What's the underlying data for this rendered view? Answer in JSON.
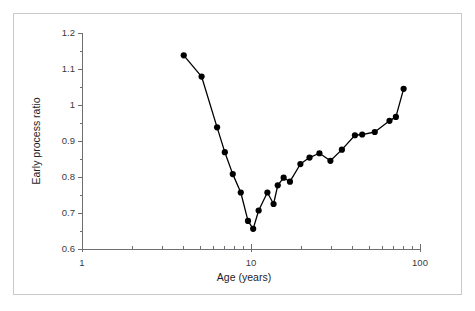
{
  "figure": {
    "background_color": "#ffffff",
    "frame_color": "#c9c9cc",
    "axis_color": "#6f6f73",
    "series_color": "#000000"
  },
  "chart_data": {
    "type": "line",
    "title": "",
    "subtitle": "",
    "xlabel": "Age (years)",
    "ylabel": "Early process ratio",
    "xscale": "log",
    "yscale": "linear",
    "xlim": [
      1,
      100
    ],
    "ylim": [
      0.6,
      1.2
    ],
    "grid": false,
    "legend": null,
    "legend_position": "none",
    "marker": "filled-circle",
    "xticks_major": [
      1,
      10,
      100
    ],
    "xtick_major_labels": [
      "1",
      "10",
      "100"
    ],
    "xticks_minor": [
      2,
      3,
      4,
      5,
      6,
      7,
      8,
      9,
      20,
      30,
      40,
      50,
      60,
      70,
      80,
      90
    ],
    "yticks": [
      0.6,
      0.7,
      0.8,
      0.9,
      1.0,
      1.1,
      1.2
    ],
    "ytick_labels": [
      "0.6",
      "0.7",
      "0.8",
      "0.9",
      "1",
      "1.1",
      "1.2"
    ],
    "series": [
      {
        "name": "Early process ratio",
        "x": [
          4.0,
          5.1,
          6.3,
          7.0,
          7.8,
          8.7,
          9.6,
          10.3,
          11.1,
          12.5,
          13.6,
          14.4,
          15.6,
          17.0,
          19.6,
          22.2,
          25.4,
          29.5,
          34.5,
          41.2,
          45.5,
          54.0,
          66.0,
          72.0,
          80.0
        ],
        "y": [
          1.138,
          1.079,
          0.938,
          0.869,
          0.808,
          0.757,
          0.678,
          0.656,
          0.707,
          0.757,
          0.725,
          0.777,
          0.798,
          0.787,
          0.836,
          0.854,
          0.866,
          0.845,
          0.876,
          0.916,
          0.918,
          0.925,
          0.956,
          0.967,
          1.045
        ]
      }
    ]
  }
}
